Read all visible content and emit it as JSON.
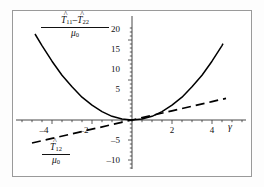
{
  "figure": {
    "background": "#ffffff",
    "frame_color": "#9a9a9a",
    "curve_color": "#000000"
  },
  "axes": {
    "x_axis_label": "γ",
    "y_axis_label": "",
    "xlim": [
      -5.4,
      5.4
    ],
    "ylim": [
      -12.5,
      23.5
    ],
    "x_ticks": [
      -4,
      -2,
      2,
      4
    ],
    "x_tick_labels": [
      "–4",
      "–2",
      "2",
      "4"
    ],
    "y_ticks": [
      -10,
      -5,
      5,
      10,
      15,
      20
    ],
    "y_tick_labels": [
      "–10",
      "–5",
      "5",
      "10",
      "15",
      "20"
    ],
    "x_minor_step": 0.5,
    "y_minor_step": 1,
    "grid": false
  },
  "annotations": {
    "curve_label": {
      "numerator_t1": "T",
      "numerator_sub1": "11",
      "numerator_minus": "–",
      "numerator_t2": "T",
      "numerator_sub2": "22",
      "denominator_mu": "μ",
      "denominator_sub": "0",
      "hat": "^"
    },
    "dashed_label": {
      "numerator_t": "T",
      "numerator_sub": "12",
      "denominator_mu": "μ",
      "denominator_sub": "0",
      "hat": "^"
    }
  },
  "chart_data": {
    "type": "line",
    "title": "",
    "xlabel": "γ",
    "ylabel": "",
    "xlim": [
      -5.4,
      5.4
    ],
    "ylim": [
      -12.5,
      23.5
    ],
    "grid": false,
    "legend": "inline-annotations",
    "series": [
      {
        "name": "(T̂11 − T̂22)/μ0",
        "style": "solid",
        "color": "#000000",
        "x": [
          -4.85,
          -4.5,
          -4.0,
          -3.5,
          -3.0,
          -2.5,
          -2.0,
          -1.5,
          -1.0,
          -0.5,
          0.0,
          0.5,
          1.0,
          1.5,
          2.0,
          2.5,
          3.0,
          3.5,
          4.0,
          4.5,
          4.55
        ],
        "y": [
          21.5,
          18.6,
          14.7,
          11.2,
          8.3,
          5.7,
          3.7,
          2.1,
          0.92,
          0.23,
          0.0,
          0.23,
          0.92,
          2.1,
          3.7,
          5.7,
          8.3,
          11.2,
          14.7,
          18.6,
          19.1
        ]
      },
      {
        "name": "T̂12/μ0",
        "style": "dashed",
        "color": "#000000",
        "x": [
          -5.0,
          -4.0,
          -3.0,
          -2.0,
          -1.0,
          0.0,
          1.0,
          2.0,
          3.0,
          4.0,
          4.7
        ],
        "y": [
          -5.75,
          -4.6,
          -3.45,
          -2.3,
          -1.15,
          0.0,
          1.15,
          2.3,
          3.45,
          4.6,
          5.4
        ]
      }
    ]
  }
}
